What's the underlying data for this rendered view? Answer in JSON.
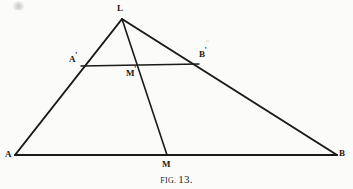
{
  "figure": {
    "caption_word": "FIG.",
    "caption_number": "13.",
    "ink_color": "#1a1a18",
    "paper_color": "#fbfbf9"
  },
  "points": {
    "L": {
      "label": "L",
      "prime": "",
      "x": 122,
      "y": 19
    },
    "A": {
      "label": "A",
      "prime": "",
      "x": 15,
      "y": 155
    },
    "B": {
      "label": "B",
      "prime": "",
      "x": 337,
      "y": 155
    },
    "M": {
      "label": "M",
      "prime": "",
      "x": 167,
      "y": 155
    },
    "Ap": {
      "label": "A",
      "prime": "'",
      "x": 81,
      "y": 66
    },
    "Bp": {
      "label": "B",
      "prime": "'",
      "x": 199,
      "y": 64
    },
    "Mp": {
      "label": "M",
      "prime": "'",
      "x": 137,
      "y": 65
    }
  },
  "segments": [
    {
      "name": "side-LA",
      "from": "L",
      "to": "A",
      "width": 2.0
    },
    {
      "name": "side-LB",
      "from": "L",
      "to": "B",
      "width": 2.0
    },
    {
      "name": "base-AB",
      "from": "A",
      "to": "B",
      "width": 2.0
    },
    {
      "name": "cevian-LM",
      "from": "L",
      "to": "M",
      "width": 1.6
    },
    {
      "name": "midline-ApBp",
      "from": "Ap",
      "to": "Bp",
      "width": 1.4
    }
  ]
}
